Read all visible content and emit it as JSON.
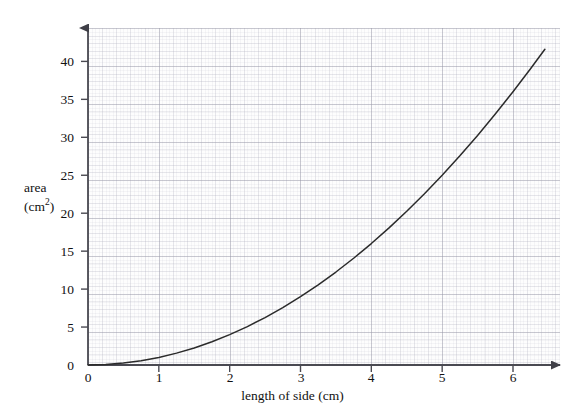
{
  "chart_data": {
    "type": "line",
    "title": "",
    "subtitle": "",
    "xlabel": "length of side (cm)",
    "ylabel": "area (cm2)",
    "ylabel_line1": "area",
    "ylabel_line2_prefix": "(cm",
    "ylabel_line2_sup": "2",
    "ylabel_line2_suffix": ")",
    "xlim": [
      0,
      6.5
    ],
    "ylim": [
      0,
      44
    ],
    "xticks": [
      0,
      1,
      2,
      3,
      4,
      5,
      6
    ],
    "yticks": [
      0,
      5,
      10,
      15,
      20,
      25,
      30,
      35,
      40
    ],
    "xtick_labels": [
      "0",
      "1",
      "2",
      "3",
      "4",
      "5",
      "6"
    ],
    "ytick_labels": [
      "0",
      "5",
      "10",
      "15",
      "20",
      "25",
      "30",
      "35",
      "40"
    ],
    "grid": true,
    "grid_style": "graph-paper",
    "legend": "none",
    "series": [
      {
        "name": "area = side squared",
        "relationship": "y = x^2",
        "color": "#2b2b2b",
        "x": [
          0,
          0.25,
          0.5,
          0.75,
          1,
          1.25,
          1.5,
          1.75,
          2,
          2.25,
          2.5,
          2.75,
          3,
          3.25,
          3.5,
          3.75,
          4,
          4.25,
          4.5,
          4.75,
          5,
          5.25,
          5.5,
          5.75,
          6,
          6.25,
          6.45
        ],
        "y": [
          0,
          0.0625,
          0.25,
          0.5625,
          1,
          1.5625,
          2.25,
          3.0625,
          4,
          5.0625,
          6.25,
          7.5625,
          9,
          10.5625,
          12.25,
          14.0625,
          16,
          18.0625,
          20.25,
          22.5625,
          25,
          27.5625,
          30.25,
          33.0625,
          36,
          39.0625,
          41.6
        ]
      }
    ],
    "colors": {
      "curve": "#2b2b2b",
      "axis": "#4a4a52",
      "grid_major": "#96969f",
      "grid_minor": "#b9b9c8",
      "background": "#ffffff",
      "plot_background": "#fdfdfd",
      "text": "#111111"
    },
    "annotations": []
  },
  "figure": {
    "name": "area-vs-length-graph",
    "x_axis_arrow": true,
    "y_axis_arrow": true
  }
}
